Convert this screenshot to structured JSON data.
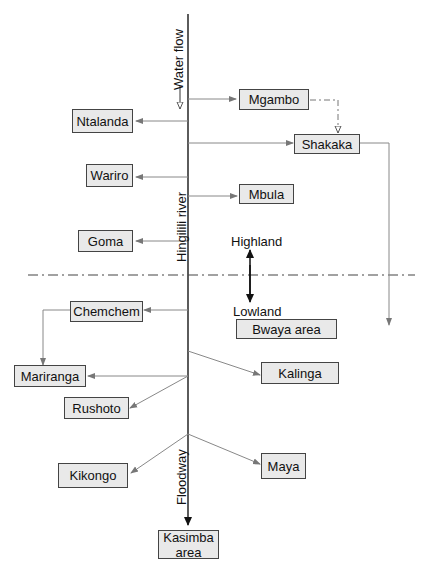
{
  "river": {
    "name": "Hingilili river",
    "top_label": "Water flow",
    "bottom_label": "Floodway"
  },
  "zones": {
    "upper": "Highland",
    "lower": "Lowland"
  },
  "nodes": {
    "mgambo": "Mgambo",
    "ntalanda": "Ntalanda",
    "shakaka": "Shakaka",
    "wariro": "Wariro",
    "mbula": "Mbula",
    "goma": "Goma",
    "chemchem": "Chemchem",
    "bwaya": "Bwaya area",
    "mariranga": "Mariranga",
    "kalinga": "Kalinga",
    "rushoto": "Rushoto",
    "kikongo": "Kikongo",
    "maya": "Maya",
    "kasimba": "Kasimba area"
  },
  "edges": [
    {
      "from": "river",
      "to": "Mgambo"
    },
    {
      "from": "river",
      "to": "Ntalanda"
    },
    {
      "from": "Mgambo",
      "to": "Shakaka",
      "style": "dash-dot"
    },
    {
      "from": "river",
      "to": "Shakaka"
    },
    {
      "from": "Shakaka",
      "to": "lowland"
    },
    {
      "from": "river",
      "to": "Wariro"
    },
    {
      "from": "river",
      "to": "Mbula"
    },
    {
      "from": "river",
      "to": "Goma"
    },
    {
      "from": "river",
      "to": "Chemchem"
    },
    {
      "from": "Chemchem",
      "to": "Mariranga"
    },
    {
      "from": "river",
      "to": "Mariranga"
    },
    {
      "from": "river",
      "to": "Kalinga"
    },
    {
      "from": "river",
      "to": "Rushoto"
    },
    {
      "from": "river",
      "to": "Kikongo"
    },
    {
      "from": "river",
      "to": "Maya"
    },
    {
      "from": "river",
      "to": "Kasimba area"
    }
  ]
}
